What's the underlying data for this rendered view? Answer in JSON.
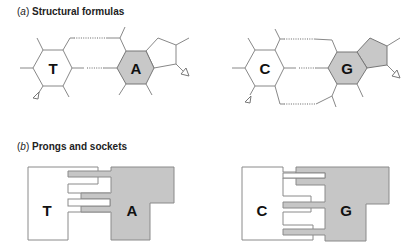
{
  "figure": {
    "panels": [
      {
        "id": "a",
        "letter": "a",
        "title": "Structural formulas",
        "pairs": [
          {
            "left_base": "T",
            "right_base": "A",
            "hydrogen_bonds": 2
          },
          {
            "left_base": "C",
            "right_base": "G",
            "hydrogen_bonds": 3
          }
        ]
      },
      {
        "id": "b",
        "letter": "b",
        "title": "Prongs and sockets",
        "pairs": [
          {
            "left_base": "T",
            "right_base": "A",
            "prongs": 2
          },
          {
            "left_base": "C",
            "right_base": "G",
            "prongs": 3
          }
        ]
      }
    ],
    "colors": {
      "purine_fill": "#c8c8c8",
      "pyrimidine_fill": "#ffffff",
      "outline": "#888888"
    }
  }
}
